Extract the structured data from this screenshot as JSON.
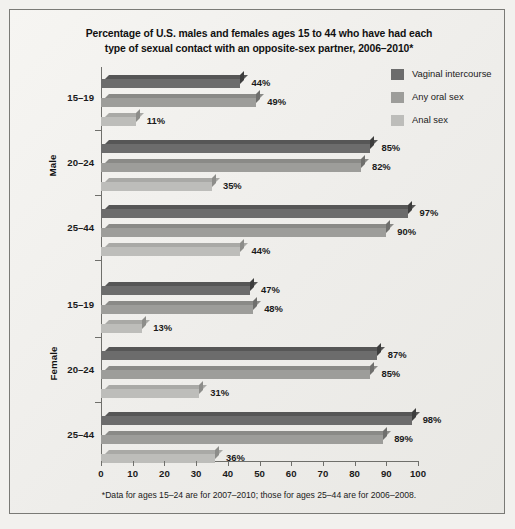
{
  "title": {
    "line1": "Percentage of U.S. males and females ages 15 to 44 who have had each",
    "line2": "type of sexual contact with an opposite-sex partner, 2006–2010*"
  },
  "footnote": "*Data for ages 15–24 are for 2007–2010; those for ages 25–44 are for 2006–2008.",
  "legend": {
    "items": [
      {
        "label": "Vaginal intercourse",
        "color": "#6c6c6c"
      },
      {
        "label": "Any oral sex",
        "color": "#9d9d9a"
      },
      {
        "label": "Anal sex",
        "color": "#bdbdba"
      }
    ]
  },
  "axis": {
    "ticks": [
      "0",
      "10",
      "20",
      "30",
      "40",
      "50",
      "60",
      "70",
      "80",
      "90",
      "100"
    ]
  },
  "groups": [
    {
      "sex": "Male",
      "age": "15–19"
    },
    {
      "sex": "Male",
      "age": "20–24"
    },
    {
      "sex": "Male",
      "age": "25–44"
    },
    {
      "sex": "Female",
      "age": "15–19"
    },
    {
      "sex": "Female",
      "age": "20–24"
    },
    {
      "sex": "Female",
      "age": "25–44"
    }
  ],
  "sex_labels": {
    "male": "Male",
    "female": "Female"
  },
  "bar_labels": [
    "44%",
    "49%",
    "11%",
    "85%",
    "82%",
    "35%",
    "97%",
    "90%",
    "44%",
    "47%",
    "48%",
    "13%",
    "87%",
    "85%",
    "31%",
    "98%",
    "89%",
    "36%"
  ],
  "chart_data": {
    "type": "bar",
    "orientation": "horizontal",
    "title": "Percentage of U.S. males and females ages 15 to 44 who have had each type of sexual contact with an opposite-sex partner, 2006–2010*",
    "xlabel": "",
    "ylabel": "",
    "xlim": [
      0,
      100
    ],
    "xticks": [
      0,
      10,
      20,
      30,
      40,
      50,
      60,
      70,
      80,
      90,
      100
    ],
    "grid": false,
    "legend_position": "top-right",
    "categories": [
      "Male 15–19",
      "Male 20–24",
      "Male 25–44",
      "Female 15–19",
      "Female 20–24",
      "Female 25–44"
    ],
    "series": [
      {
        "name": "Vaginal intercourse",
        "color": "#6c6c6c",
        "values": [
          44,
          85,
          97,
          47,
          87,
          98
        ]
      },
      {
        "name": "Any oral sex",
        "color": "#9d9d9a",
        "values": [
          49,
          82,
          90,
          48,
          85,
          89
        ]
      },
      {
        "name": "Anal sex",
        "color": "#bdbdba",
        "values": [
          11,
          35,
          44,
          13,
          31,
          36
        ]
      }
    ],
    "annotations": {
      "footnote": "*Data for ages 15–24 are for 2007–2010; those for ages 25–44 are for 2006–2008."
    }
  }
}
